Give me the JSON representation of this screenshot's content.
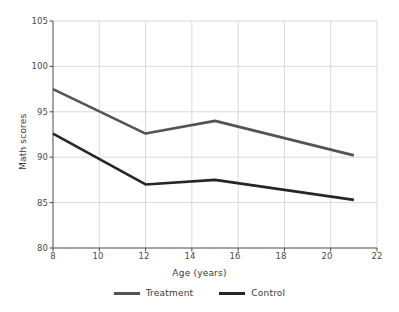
{
  "chart_data": {
    "type": "line",
    "title": "",
    "xlabel": "Age (years)",
    "ylabel": "Math scores",
    "xlim": [
      8,
      22
    ],
    "ylim": [
      80,
      105
    ],
    "xticks": [
      8,
      10,
      12,
      14,
      16,
      18,
      20,
      22
    ],
    "yticks": [
      80,
      85,
      90,
      95,
      100,
      105
    ],
    "grid": true,
    "legend_position": "bottom",
    "x": [
      8,
      12,
      15,
      21
    ],
    "series": [
      {
        "name": "Treatment",
        "color": "#545454",
        "x": [
          8,
          12,
          15,
          21
        ],
        "values": [
          97.5,
          92.6,
          94.0,
          90.2
        ]
      },
      {
        "name": "Control",
        "color": "#262626",
        "x": [
          8,
          12,
          15,
          21
        ],
        "values": [
          92.6,
          87.0,
          87.5,
          85.3
        ]
      }
    ]
  },
  "axes": {
    "y_tick_labels": [
      "105",
      "100",
      "95",
      "90",
      "85",
      "80"
    ],
    "x_tick_labels": [
      "8",
      "10",
      "12",
      "14",
      "16",
      "18",
      "20",
      "22"
    ],
    "x_axis_title": "Age (years)",
    "y_axis_title": "Math scores"
  },
  "legend": {
    "items": [
      {
        "label": "Treatment",
        "color": "#545454"
      },
      {
        "label": "Control",
        "color": "#262626"
      }
    ]
  },
  "style": {
    "background": "#ffffff",
    "grid_color": "#d9d9d9",
    "axis_color": "#4a4a4a",
    "text_color": "#3a3a3a"
  }
}
